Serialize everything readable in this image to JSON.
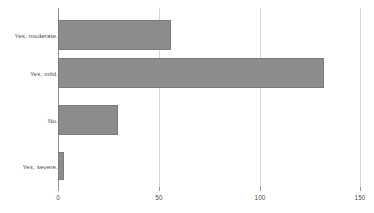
{
  "chart_data": {
    "type": "bar",
    "orientation": "horizontal",
    "title": "",
    "subtitle": "",
    "xlabel": "",
    "ylabel": "",
    "categories": [
      "Yes, moderate.",
      "Yes, mild.",
      "No.",
      "Yes, severe."
    ],
    "values": [
      56,
      132,
      30,
      3
    ],
    "series": [
      {
        "name": "",
        "values": [
          56,
          132,
          30,
          3
        ]
      }
    ],
    "xlim": [
      0,
      150
    ],
    "ylim": null,
    "xticks": [
      0,
      50,
      100,
      150
    ],
    "xtick_labels": [
      "0",
      "50",
      "100",
      "150"
    ],
    "grid": "vertical",
    "legend": "none",
    "annotations": [],
    "colors": {
      "bar_fill": "#8c8c8c",
      "bar_border": "#7a7a7a",
      "gridline": "#d6d6d6",
      "axis_line": "#8f8f8f",
      "tick_label": "#4a4a4a",
      "category_label": "#4a4a4a",
      "background": "#ffffff"
    }
  }
}
